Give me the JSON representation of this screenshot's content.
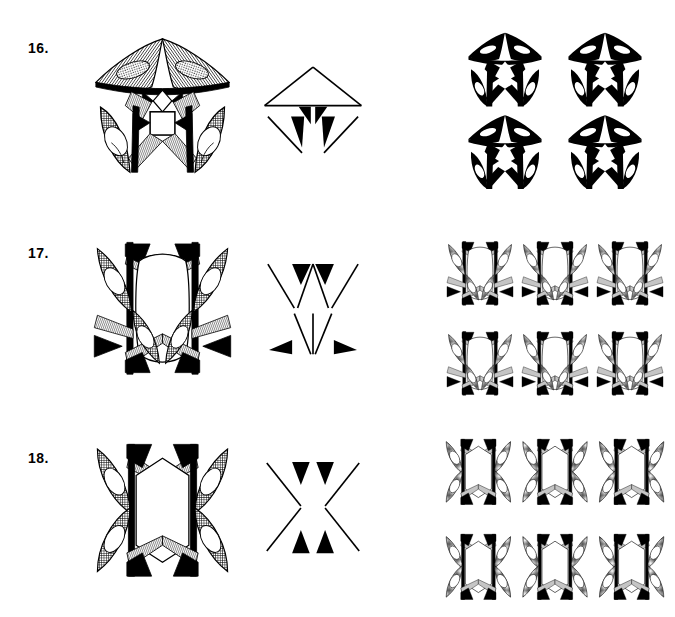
{
  "page": {
    "background_color": "#ffffff",
    "ink_color": "#000000",
    "width": 675,
    "height": 617
  },
  "rows": [
    {
      "id": "row-16",
      "label": "16.",
      "label_x": 28,
      "label_y": 40,
      "top": 20,
      "motif": {
        "name": "canopy-motif",
        "x": 85,
        "y": 25,
        "width": 155,
        "height": 155,
        "kind": "detailed-engraving",
        "description": "Wide arching canopy with two hatched lobes over a square block, flanked by two upright leaves",
        "symmetry": "bilateral-vertical"
      },
      "skeleton": {
        "name": "canopy-skeleton",
        "x": 258,
        "y": 55,
        "width": 110,
        "height": 110,
        "kind": "line-diagram",
        "description": "Open triangular roof line above two slender downward wedges"
      },
      "pattern": {
        "name": "canopy-repeat-pattern",
        "x": 440,
        "y": 25,
        "width": 230,
        "height": 165,
        "kind": "tiled-repeat",
        "columns": 2,
        "rows": 2,
        "description": "Two by two repeat of the solid-black canopy motif"
      }
    },
    {
      "id": "row-17",
      "label": "17.",
      "label_x": 28,
      "label_y": 245,
      "top": 225,
      "motif": {
        "name": "lyre-motif",
        "x": 85,
        "y": 230,
        "width": 155,
        "height": 155,
        "kind": "detailed-engraving",
        "description": "Pair of vertical stems with barbed tips enclosing an oval void, crossed by curved hatched leaves",
        "symmetry": "bilateral-vertical"
      },
      "skeleton": {
        "name": "lyre-skeleton",
        "x": 258,
        "y": 252,
        "width": 110,
        "height": 110,
        "kind": "line-diagram",
        "description": "Two splayed V strokes above an M stroke, each terminating in solid black barbs"
      },
      "pattern": {
        "name": "lyre-repeat-pattern",
        "x": 440,
        "y": 228,
        "width": 230,
        "height": 180,
        "kind": "tiled-repeat",
        "columns": 3,
        "rows": 2,
        "description": "Three by two lattice repeat of the lyre motif forming continuous vertical bands"
      }
    },
    {
      "id": "row-18",
      "label": "18.",
      "label_x": 28,
      "label_y": 450,
      "top": 428,
      "motif": {
        "name": "column-motif",
        "x": 85,
        "y": 432,
        "width": 155,
        "height": 155,
        "kind": "detailed-engraving",
        "description": "Two straight vertical stems with swallowtail ends framing a hexagonal void, with outer sickle leaves",
        "symmetry": "bilateral-vertical"
      },
      "skeleton": {
        "name": "column-skeleton",
        "x": 258,
        "y": 452,
        "width": 110,
        "height": 110,
        "kind": "line-diagram",
        "description": "Two mirrored hourglass strokes with black barbed tips"
      },
      "pattern": {
        "name": "column-repeat-pattern",
        "x": 440,
        "y": 424,
        "width": 230,
        "height": 190,
        "kind": "tiled-repeat",
        "columns": 3,
        "rows": 2,
        "description": "Three by two lattice repeat of the column motif forming continuous vertical bands"
      }
    }
  ]
}
